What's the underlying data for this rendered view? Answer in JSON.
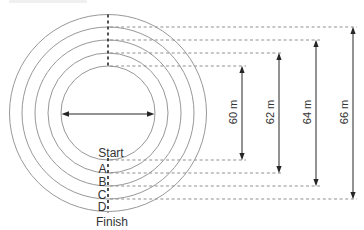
{
  "diagram": {
    "kind": "concentric-track-diagram",
    "start_label": "Start",
    "finish_label": "Finish",
    "lane_labels": [
      "A",
      "B",
      "C",
      "D"
    ],
    "measurements": [
      "60 m",
      "62 m",
      "64 m",
      "66 m"
    ],
    "diameters_m": [
      60,
      62,
      64,
      66
    ],
    "colors": {
      "background": "#ffffff",
      "circle_stroke": "#989898",
      "guide_stroke": "#8f8f8f",
      "ink": "#262626",
      "text": "#333333"
    }
  }
}
